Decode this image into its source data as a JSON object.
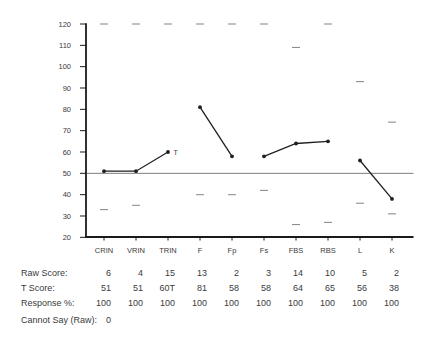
{
  "chart_data": {
    "type": "line",
    "title": "",
    "scales": [
      "CRIN",
      "VRIN",
      "TRIN",
      "F",
      "Fp",
      "Fs",
      "FBS",
      "RBS",
      "L",
      "K"
    ],
    "t_scores": [
      51,
      51,
      60,
      81,
      58,
      58,
      64,
      65,
      56,
      38
    ],
    "t_score_display": [
      "51",
      "51",
      "60T",
      "81",
      "58",
      "58",
      "64",
      "65",
      "56",
      "38"
    ],
    "segments": [
      [
        0,
        1,
        2
      ],
      [
        3,
        4
      ],
      [
        5,
        6,
        7
      ],
      [
        8,
        9
      ]
    ],
    "max_possible_t": [
      120,
      120,
      120,
      120,
      120,
      120,
      109,
      120,
      93,
      74
    ],
    "min_possible_t": [
      33,
      35,
      null,
      40,
      40,
      42,
      26,
      27,
      36,
      31
    ],
    "y_axis": {
      "min": 20,
      "max": 120,
      "step": 10,
      "reference_line": 50
    },
    "trin_point_label": "T",
    "colors": {
      "profile_line": "#1f1f1f",
      "axis": "#1a1a1a",
      "reference_line": "#7d7d7d",
      "range_dash": "#8f8f8f",
      "text": "#3a3a3a"
    }
  },
  "table": {
    "rows": [
      {
        "label": "Raw Score:",
        "values": [
          "6",
          "4",
          "15",
          "13",
          "2",
          "3",
          "14",
          "10",
          "5",
          "2"
        ]
      },
      {
        "label": "T Score:",
        "values": [
          "51",
          "51",
          "60T",
          "81",
          "58",
          "58",
          "64",
          "65",
          "56",
          "38"
        ]
      },
      {
        "label": "Response %:",
        "values": [
          "100",
          "100",
          "100",
          "100",
          "100",
          "100",
          "100",
          "100",
          "100",
          "100"
        ]
      },
      {
        "label": "Cannot Say (Raw):",
        "values": [
          "0"
        ]
      }
    ]
  }
}
